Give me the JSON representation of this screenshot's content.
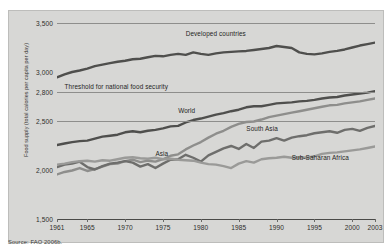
{
  "figure": {
    "source_note": "Source: FAO 2006b.",
    "background_color": "#d7d7d5",
    "border_color": "#bdbdbb"
  },
  "chart_data": {
    "type": "line",
    "title": "",
    "xlabel": "",
    "ylabel": "Food supply (total calories per capita per day)",
    "xlim": [
      1961,
      2003
    ],
    "ylim": [
      1500,
      3500
    ],
    "ytick_values": [
      1500,
      2000,
      2500,
      2800,
      3000,
      3500
    ],
    "ytick_labels": [
      "1,500",
      "2,000",
      "2,500",
      "2,800",
      "3,000",
      "3,500"
    ],
    "xtick_values": [
      1961,
      1965,
      1970,
      1975,
      1980,
      1985,
      1990,
      1995,
      2000,
      2003
    ],
    "xtick_labels": [
      "1961",
      "1965",
      "1970",
      "1975",
      "1980",
      "1985",
      "1990",
      "1995",
      "2000",
      "2003"
    ],
    "grid": true,
    "gridline_values": [
      3500,
      2800,
      2500
    ],
    "legend_position": "inline-labels",
    "annotations": [
      {
        "text": "Threshold for national food security",
        "value": 2800,
        "x": 1962,
        "color": "#1f1f1d"
      }
    ],
    "x": [
      1961,
      1962,
      1963,
      1964,
      1965,
      1966,
      1967,
      1968,
      1969,
      1970,
      1971,
      1972,
      1973,
      1974,
      1975,
      1976,
      1977,
      1978,
      1979,
      1980,
      1981,
      1982,
      1983,
      1984,
      1985,
      1986,
      1987,
      1988,
      1989,
      1990,
      1991,
      1992,
      1993,
      1994,
      1995,
      1996,
      1997,
      1998,
      1999,
      2000,
      2001,
      2002,
      2003
    ],
    "series": [
      {
        "name": "Developed countries",
        "color": "#4f4f4d",
        "width": 2.4,
        "label_x": 1978,
        "label_y": 3390,
        "values": [
          2945,
          2975,
          3000,
          3015,
          3035,
          3060,
          3075,
          3090,
          3105,
          3115,
          3130,
          3135,
          3150,
          3165,
          3160,
          3175,
          3185,
          3175,
          3200,
          3185,
          3175,
          3190,
          3200,
          3205,
          3210,
          3215,
          3225,
          3235,
          3245,
          3265,
          3255,
          3245,
          3200,
          3185,
          3180,
          3190,
          3205,
          3215,
          3230,
          3250,
          3270,
          3285,
          3300
        ]
      },
      {
        "name": "World",
        "color": "#4f4f4d",
        "width": 2.4,
        "label_x": 1977,
        "label_y": 2600,
        "values": [
          2255,
          2270,
          2285,
          2295,
          2300,
          2320,
          2340,
          2350,
          2360,
          2385,
          2395,
          2385,
          2400,
          2410,
          2425,
          2445,
          2450,
          2485,
          2510,
          2525,
          2545,
          2565,
          2580,
          2600,
          2615,
          2640,
          2650,
          2650,
          2665,
          2680,
          2685,
          2690,
          2700,
          2705,
          2715,
          2730,
          2740,
          2745,
          2760,
          2770,
          2780,
          2790,
          2805
        ]
      },
      {
        "name": "Asia",
        "color": "#8e8e8c",
        "width": 2.4,
        "label_x": 1974,
        "label_y": 2160,
        "values": [
          1955,
          1980,
          1995,
          2020,
          1990,
          2010,
          2035,
          2060,
          2065,
          2090,
          2105,
          2080,
          2095,
          2085,
          2110,
          2145,
          2160,
          2210,
          2250,
          2285,
          2330,
          2370,
          2400,
          2440,
          2470,
          2490,
          2495,
          2515,
          2540,
          2555,
          2570,
          2585,
          2600,
          2615,
          2630,
          2645,
          2660,
          2665,
          2680,
          2690,
          2700,
          2715,
          2730
        ]
      },
      {
        "name": "South Asia",
        "color": "#6e6e6c",
        "width": 2.4,
        "label_x": 1986,
        "label_y": 2420,
        "values": [
          2030,
          2055,
          2065,
          2085,
          2030,
          2005,
          2040,
          2065,
          2075,
          2090,
          2075,
          2035,
          2060,
          2020,
          2065,
          2105,
          2110,
          2155,
          2125,
          2085,
          2150,
          2185,
          2220,
          2245,
          2215,
          2265,
          2225,
          2290,
          2300,
          2325,
          2300,
          2330,
          2345,
          2355,
          2375,
          2385,
          2395,
          2380,
          2410,
          2420,
          2400,
          2430,
          2450
        ]
      },
      {
        "name": "Sub-Saharan Africa",
        "color": "#9a9a98",
        "width": 2.4,
        "label_x": 1992,
        "label_y": 2120,
        "values": [
          2055,
          2065,
          2080,
          2090,
          2095,
          2085,
          2100,
          2095,
          2110,
          2125,
          2130,
          2120,
          2115,
          2125,
          2110,
          2115,
          2105,
          2100,
          2095,
          2075,
          2060,
          2055,
          2040,
          2020,
          2065,
          2090,
          2075,
          2110,
          2120,
          2125,
          2135,
          2125,
          2130,
          2125,
          2140,
          2165,
          2175,
          2180,
          2190,
          2200,
          2210,
          2225,
          2240
        ]
      }
    ]
  }
}
